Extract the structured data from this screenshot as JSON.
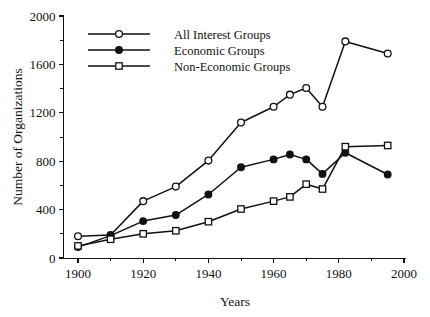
{
  "chart_data": {
    "type": "line",
    "title": "",
    "xlabel": "Years",
    "ylabel": "Number of Organizations",
    "xlim": [
      1895,
      2000
    ],
    "ylim": [
      0,
      2000
    ],
    "x_ticks": [
      1900,
      1920,
      1940,
      1960,
      1980,
      2000
    ],
    "x_tick_labels": [
      "1900",
      "1920",
      "1940",
      "1960",
      "1980",
      "2000"
    ],
    "x_minor_ticks": [
      1910,
      1930,
      1950,
      1970,
      1990
    ],
    "y_ticks": [
      0,
      400,
      800,
      1200,
      1600,
      2000
    ],
    "y_tick_labels": [
      "0",
      "400",
      "800",
      "1200",
      "1600",
      "2000"
    ],
    "y_minor_ticks": [
      200,
      600,
      1000,
      1400,
      1800
    ],
    "grid": false,
    "legend_position": "top-left",
    "series": [
      {
        "name": "All Interest Groups",
        "marker": "open-circle",
        "x": [
          1900,
          1910,
          1920,
          1930,
          1940,
          1950,
          1960,
          1965,
          1970,
          1975,
          1982,
          1995
        ],
        "values": [
          180,
          190,
          470,
          590,
          805,
          1120,
          1250,
          1350,
          1405,
          1250,
          1790,
          1690
        ]
      },
      {
        "name": "Economic Groups",
        "marker": "filled-circle",
        "x": [
          1900,
          1910,
          1920,
          1930,
          1940,
          1950,
          1960,
          1965,
          1970,
          1975,
          1982,
          1995
        ],
        "values": [
          90,
          185,
          305,
          355,
          525,
          750,
          815,
          855,
          815,
          695,
          870,
          690
        ]
      },
      {
        "name": "Non-Economic Groups",
        "marker": "open-square",
        "x": [
          1900,
          1910,
          1920,
          1930,
          1940,
          1950,
          1960,
          1965,
          1970,
          1975,
          1982,
          1995
        ],
        "values": [
          100,
          155,
          200,
          225,
          300,
          405,
          470,
          505,
          610,
          570,
          920,
          930
        ]
      }
    ]
  },
  "axes": {
    "y_title": "Number of Organizations",
    "x_title": "Years"
  },
  "legend": {
    "items": [
      {
        "label": "All Interest Groups",
        "marker": "open-circle"
      },
      {
        "label": "Economic Groups",
        "marker": "filled-circle"
      },
      {
        "label": "Non-Economic Groups",
        "marker": "open-square"
      }
    ]
  },
  "colors": {
    "ink": "#111111",
    "background": "#ffffff"
  }
}
